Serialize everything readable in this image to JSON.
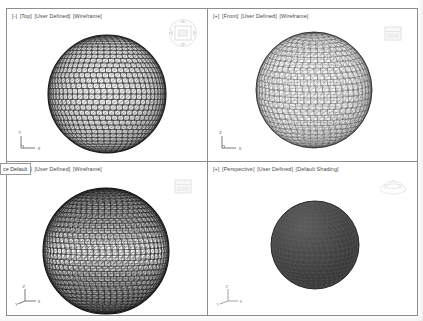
{
  "application": {
    "layout": "four-viewport",
    "colors": {
      "viewport_border": "#8d8d8d",
      "background": "#ffffff",
      "label_text": "#4a4a4a",
      "wireframe": "#2b2b2b",
      "shaded_fill": "#3a3a3a"
    }
  },
  "viewports": [
    {
      "id": "top-left",
      "label": {
        "toggle": "[-]",
        "view": "[Top]",
        "visual_preset": "[User Defined]",
        "visual_style": "[Wireframe]"
      },
      "ucs": {
        "type": "2d-ucs-icon",
        "axes": [
          "Y",
          "X"
        ]
      },
      "viewcube": {
        "label": "view-cube",
        "visible": true
      },
      "model": {
        "type": "geodesic-sphere-wireframe",
        "density": "high",
        "shading": "none"
      }
    },
    {
      "id": "top-right",
      "label": {
        "toggle": "[+]",
        "view": "[Front]",
        "visual_preset": "[User Defined]",
        "visual_style": "[Wireframe]"
      },
      "ucs": {
        "type": "2d-ucs-icon",
        "axes": [
          "Z",
          "X"
        ]
      },
      "viewcube": {
        "label": "view-cube",
        "visible": true
      },
      "model": {
        "type": "geodesic-sphere-wireframe",
        "density": "medium",
        "shading": "none"
      }
    },
    {
      "id": "bottom-left",
      "label": {
        "toggle": "[-]",
        "view": "[Top]",
        "visual_preset": "[User Defined]",
        "visual_style": "[Wireframe]"
      },
      "ucs": {
        "type": "3d-ucs-icon",
        "axes": [
          "Z",
          "Y",
          "X"
        ]
      },
      "viewcube": {
        "label": "view-cube",
        "visible": true
      },
      "model": {
        "type": "geodesic-sphere-wireframe",
        "density": "high",
        "shading": "banded"
      }
    },
    {
      "id": "bottom-right",
      "label": {
        "toggle": "[+]",
        "view": "[Perspective]",
        "visual_preset": "[User Defined]",
        "visual_style": "[Default Shading]"
      },
      "ucs": {
        "type": "3d-ucs-icon",
        "axes": [
          "Z",
          "Y",
          "X"
        ]
      },
      "viewcube": {
        "label": "view-cube",
        "visible": true
      },
      "model": {
        "type": "geodesic-sphere-shaded",
        "density": "high",
        "shading": "solid-dark"
      }
    }
  ],
  "overlay": {
    "tooltip_text": "ce Default"
  }
}
